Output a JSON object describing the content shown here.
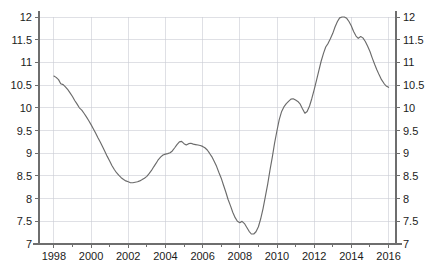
{
  "chart_data": {
    "type": "line",
    "title": "",
    "subtitle": "",
    "xlabel": "",
    "ylabel": "",
    "xlim": [
      1997.2,
      2016.4
    ],
    "ylim": [
      7,
      12
    ],
    "grid": true,
    "legend": null,
    "y_ticks": [
      7,
      7.5,
      8,
      8.5,
      9,
      9.5,
      10,
      10.5,
      11,
      11.5,
      12
    ],
    "y_tick_labels": [
      "7",
      "7.5",
      "8",
      "8.5",
      "9",
      "9.5",
      "10",
      "10.5",
      "11",
      "11.5",
      "12"
    ],
    "y_axis_right_labels": [
      "7",
      "7.5",
      "8",
      "8.5",
      "9",
      "9.5",
      "10",
      "10.5",
      "11",
      "11.5",
      "12"
    ],
    "x_ticks": [
      1998,
      2000,
      2002,
      2004,
      2006,
      2008,
      2010,
      2012,
      2014,
      2016
    ],
    "x_tick_labels": [
      "1998",
      "2000",
      "2002",
      "2004",
      "2006",
      "2008",
      "2010",
      "2012",
      "2014",
      "2016"
    ],
    "x_minor_ticks": [
      1999,
      2001,
      2003,
      2005,
      2007,
      2009,
      2011,
      2013,
      2015
    ],
    "colors": {
      "series_line": "#6b6b6b",
      "gridline": "#c9ccd4",
      "axis": "#6e6e6e",
      "text": "#1b1b1b",
      "background": "#ffffff"
    },
    "series": [
      {
        "name": "series-1",
        "x": [
          1998.0,
          1998.17,
          1998.33,
          1998.5,
          1998.67,
          1998.83,
          1999.0,
          1999.17,
          1999.33,
          1999.5,
          1999.67,
          1999.83,
          2000.0,
          2000.17,
          2000.33,
          2000.5,
          2000.67,
          2000.83,
          2001.0,
          2001.17,
          2001.33,
          2001.5,
          2001.67,
          2001.83,
          2002.0,
          2002.17,
          2002.33,
          2002.5,
          2002.67,
          2002.83,
          2003.0,
          2003.17,
          2003.33,
          2003.5,
          2003.67,
          2003.83,
          2004.0,
          2004.17,
          2004.33,
          2004.5,
          2004.67,
          2004.83,
          2005.0,
          2005.17,
          2005.33,
          2005.5,
          2005.67,
          2005.83,
          2006.0,
          2006.17,
          2006.33,
          2006.5,
          2006.67,
          2006.83,
          2007.0,
          2007.17,
          2007.33,
          2007.5,
          2007.67,
          2007.83,
          2008.0,
          2008.17,
          2008.33,
          2008.5,
          2008.67,
          2008.83,
          2009.0,
          2009.17,
          2009.33,
          2009.5,
          2009.67,
          2009.83,
          2010.0,
          2010.17,
          2010.33,
          2010.5,
          2010.67,
          2010.83,
          2011.0,
          2011.17,
          2011.33,
          2011.5,
          2011.67,
          2011.83,
          2012.0,
          2012.17,
          2012.33,
          2012.5,
          2012.67,
          2012.83,
          2013.0,
          2013.17,
          2013.33,
          2013.5,
          2013.67,
          2013.83,
          2014.0,
          2014.17,
          2014.33,
          2014.5,
          2014.67,
          2014.83,
          2015.0,
          2015.17,
          2015.33,
          2015.5,
          2015.67,
          2015.83,
          2016.0
        ],
        "y": [
          10.7,
          10.66,
          10.62,
          10.52,
          10.5,
          10.42,
          10.33,
          10.2,
          10.1,
          10.0,
          9.92,
          9.8,
          9.68,
          9.55,
          9.42,
          9.28,
          9.12,
          8.98,
          8.84,
          8.7,
          8.58,
          8.5,
          8.44,
          8.38,
          8.36,
          8.35,
          8.36,
          8.38,
          8.4,
          8.44,
          8.48,
          8.54,
          8.62,
          8.72,
          8.82,
          8.9,
          8.96,
          8.99,
          9.0,
          9.03,
          9.1,
          9.17,
          9.24,
          9.26,
          9.2,
          9.18,
          9.21,
          9.2,
          9.18,
          9.17,
          9.14,
          9.1,
          9.04,
          8.94,
          8.82,
          8.68,
          8.52,
          8.34,
          8.16,
          7.98,
          7.8,
          7.64,
          7.52,
          7.46,
          7.5,
          7.46,
          7.38,
          7.28,
          7.22,
          7.24,
          7.32,
          7.46,
          7.68,
          7.94,
          8.22,
          8.52,
          8.84,
          9.14,
          9.44,
          9.72,
          9.94,
          10.06,
          10.12,
          10.16,
          10.2,
          10.21,
          10.18,
          10.14,
          10.08,
          9.96,
          9.88,
          9.93,
          10.06,
          10.22,
          10.42,
          10.62,
          10.84,
          11.04,
          11.22,
          11.38,
          11.46,
          11.56,
          11.7,
          11.84,
          11.94,
          12.0,
          12.0,
          11.96,
          11.9
        ],
        "note": "values extend past 2016 tick; second half of series continues to 10.45"
      },
      {
        "name": "series-1-tail",
        "x": [
          2014.0,
          2014.17,
          2014.33,
          2014.5,
          2014.67,
          2014.83,
          2015.0,
          2015.17,
          2015.33,
          2015.5,
          2015.67,
          2015.83,
          2016.0
        ],
        "y": [
          11.88,
          11.74,
          11.58,
          11.54,
          11.56,
          11.5,
          11.42,
          11.28,
          11.12,
          10.96,
          10.8,
          10.62,
          10.45
        ]
      }
    ],
    "full_series": {
      "name": "indicator",
      "points": [
        [
          1998.0,
          10.7
        ],
        [
          1998.12,
          10.67
        ],
        [
          1998.25,
          10.62
        ],
        [
          1998.37,
          10.53
        ],
        [
          1998.5,
          10.51
        ],
        [
          1998.62,
          10.46
        ],
        [
          1998.75,
          10.4
        ],
        [
          1998.87,
          10.33
        ],
        [
          1999.0,
          10.25
        ],
        [
          1999.12,
          10.16
        ],
        [
          1999.25,
          10.08
        ],
        [
          1999.37,
          10.0
        ],
        [
          1999.5,
          9.95
        ],
        [
          1999.62,
          9.88
        ],
        [
          1999.75,
          9.8
        ],
        [
          1999.87,
          9.72
        ],
        [
          2000.0,
          9.63
        ],
        [
          2000.12,
          9.54
        ],
        [
          2000.25,
          9.44
        ],
        [
          2000.37,
          9.34
        ],
        [
          2000.5,
          9.24
        ],
        [
          2000.62,
          9.14
        ],
        [
          2000.75,
          9.03
        ],
        [
          2000.87,
          8.93
        ],
        [
          2001.0,
          8.83
        ],
        [
          2001.12,
          8.73
        ],
        [
          2001.25,
          8.64
        ],
        [
          2001.37,
          8.57
        ],
        [
          2001.5,
          8.51
        ],
        [
          2001.62,
          8.46
        ],
        [
          2001.75,
          8.42
        ],
        [
          2001.87,
          8.39
        ],
        [
          2002.0,
          8.37
        ],
        [
          2002.12,
          8.35
        ],
        [
          2002.25,
          8.35
        ],
        [
          2002.37,
          8.36
        ],
        [
          2002.5,
          8.37
        ],
        [
          2002.62,
          8.39
        ],
        [
          2002.75,
          8.42
        ],
        [
          2002.87,
          8.45
        ],
        [
          2003.0,
          8.49
        ],
        [
          2003.12,
          8.55
        ],
        [
          2003.25,
          8.62
        ],
        [
          2003.37,
          8.7
        ],
        [
          2003.5,
          8.78
        ],
        [
          2003.62,
          8.86
        ],
        [
          2003.75,
          8.92
        ],
        [
          2003.87,
          8.96
        ],
        [
          2004.0,
          8.98
        ],
        [
          2004.12,
          8.99
        ],
        [
          2004.25,
          9.01
        ],
        [
          2004.37,
          9.05
        ],
        [
          2004.5,
          9.12
        ],
        [
          2004.62,
          9.19
        ],
        [
          2004.75,
          9.25
        ],
        [
          2004.87,
          9.26
        ],
        [
          2005.0,
          9.21
        ],
        [
          2005.12,
          9.18
        ],
        [
          2005.25,
          9.21
        ],
        [
          2005.37,
          9.22
        ],
        [
          2005.5,
          9.2
        ],
        [
          2005.62,
          9.19
        ],
        [
          2005.75,
          9.18
        ],
        [
          2005.87,
          9.17
        ],
        [
          2006.0,
          9.15
        ],
        [
          2006.12,
          9.12
        ],
        [
          2006.25,
          9.07
        ],
        [
          2006.37,
          9.0
        ],
        [
          2006.5,
          8.92
        ],
        [
          2006.62,
          8.82
        ],
        [
          2006.75,
          8.71
        ],
        [
          2006.87,
          8.58
        ],
        [
          2007.0,
          8.45
        ],
        [
          2007.12,
          8.3
        ],
        [
          2007.25,
          8.14
        ],
        [
          2007.37,
          7.98
        ],
        [
          2007.5,
          7.84
        ],
        [
          2007.62,
          7.7
        ],
        [
          2007.75,
          7.58
        ],
        [
          2007.87,
          7.5
        ],
        [
          2008.0,
          7.47
        ],
        [
          2008.12,
          7.5
        ],
        [
          2008.25,
          7.45
        ],
        [
          2008.37,
          7.37
        ],
        [
          2008.5,
          7.28
        ],
        [
          2008.62,
          7.22
        ],
        [
          2008.75,
          7.22
        ],
        [
          2008.87,
          7.27
        ],
        [
          2009.0,
          7.38
        ],
        [
          2009.12,
          7.55
        ],
        [
          2009.25,
          7.78
        ],
        [
          2009.37,
          8.04
        ],
        [
          2009.5,
          8.32
        ],
        [
          2009.62,
          8.62
        ],
        [
          2009.75,
          8.92
        ],
        [
          2009.87,
          9.22
        ],
        [
          2010.0,
          9.5
        ],
        [
          2010.12,
          9.74
        ],
        [
          2010.25,
          9.92
        ],
        [
          2010.37,
          10.02
        ],
        [
          2010.5,
          10.09
        ],
        [
          2010.62,
          10.14
        ],
        [
          2010.75,
          10.19
        ],
        [
          2010.87,
          10.2
        ],
        [
          2011.0,
          10.17
        ],
        [
          2011.12,
          10.14
        ],
        [
          2011.25,
          10.08
        ],
        [
          2011.37,
          9.98
        ],
        [
          2011.5,
          9.88
        ],
        [
          2011.62,
          9.92
        ],
        [
          2011.75,
          10.04
        ],
        [
          2011.87,
          10.2
        ],
        [
          2012.0,
          10.4
        ],
        [
          2012.12,
          10.6
        ],
        [
          2012.25,
          10.82
        ],
        [
          2012.37,
          11.02
        ],
        [
          2012.5,
          11.2
        ],
        [
          2012.62,
          11.34
        ],
        [
          2012.75,
          11.42
        ],
        [
          2012.87,
          11.52
        ],
        [
          2013.0,
          11.64
        ],
        [
          2013.12,
          11.78
        ],
        [
          2013.25,
          11.9
        ],
        [
          2013.37,
          11.98
        ],
        [
          2013.5,
          12.0
        ],
        [
          2013.62,
          12.0
        ],
        [
          2013.75,
          11.97
        ],
        [
          2013.87,
          11.9
        ],
        [
          2014.0,
          11.8
        ],
        [
          2014.12,
          11.68
        ],
        [
          2014.25,
          11.58
        ],
        [
          2014.37,
          11.53
        ],
        [
          2014.5,
          11.57
        ],
        [
          2014.62,
          11.54
        ],
        [
          2014.75,
          11.46
        ],
        [
          2014.87,
          11.36
        ],
        [
          2015.0,
          11.24
        ],
        [
          2015.12,
          11.1
        ],
        [
          2015.25,
          10.96
        ],
        [
          2015.37,
          10.84
        ],
        [
          2015.5,
          10.72
        ],
        [
          2015.62,
          10.62
        ],
        [
          2015.75,
          10.54
        ],
        [
          2015.87,
          10.48
        ],
        [
          2016.0,
          10.45
        ]
      ]
    },
    "annotations": [],
    "key_features": {
      "start_value": 10.7,
      "start_year": 1998,
      "end_value": 10.45,
      "end_year": 2016,
      "max_value": 12.0,
      "max_year": 2013.5,
      "min_value": 7.22,
      "min_year": 2008.7,
      "local_min_2002": 8.35,
      "local_max_2004": 9.26,
      "local_max_2010": 10.2,
      "local_min_2011": 9.88
    }
  }
}
